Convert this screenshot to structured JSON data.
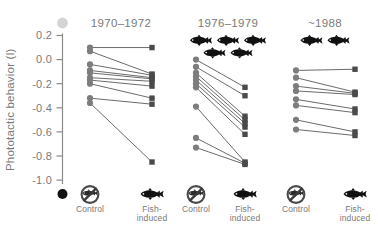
{
  "figure": {
    "background_color": "#ffffff",
    "text_color": "#7a7a7a",
    "marker_control_color": "#7d7d7d",
    "marker_fish_color": "#4a4a4a",
    "line_color": "#5a5a5a",
    "icon_color": "#111111"
  },
  "axis": {
    "title": "Phototactic behavior (l)",
    "tick_labels": [
      "0.2",
      "0.0",
      "-0.2",
      "-0.4",
      "-0.6",
      "-0.8",
      "-1.0"
    ],
    "tick_values": [
      0.2,
      0.0,
      -0.2,
      -0.4,
      -0.6,
      -0.8,
      -1.0
    ],
    "top_cap_marker": "light-grey-circle",
    "bottom_cap_marker": "black-circle"
  },
  "categories": {
    "control": {
      "label": "Control",
      "icon": "no-fish-icon",
      "icon_description": "fish silhouette inside circle with diagonal slash"
    },
    "fish_induced": {
      "label_line1": "Fish-",
      "label_line2": "induced",
      "label": "Fish-induced",
      "icon": "fish-icon",
      "icon_description": "fish silhouette"
    }
  },
  "panels": [
    {
      "title": "1970–1972",
      "fish_badge_count": 0,
      "fish_badge_rows": []
    },
    {
      "title": "1976–1979",
      "fish_badge_count": 5,
      "fish_badge_rows": [
        3,
        2
      ]
    },
    {
      "title": "~1988",
      "fish_badge_count": 2,
      "fish_badge_rows": [
        2
      ]
    }
  ],
  "chart_data": {
    "type": "line",
    "xlabel": "",
    "ylabel": "Phototactic behavior (l)",
    "ylim": [
      -1.05,
      0.25
    ],
    "yticks": [
      0.2,
      0.0,
      -0.2,
      -0.4,
      -0.6,
      -0.8,
      -1.0
    ],
    "grid": false,
    "legend": "none",
    "x_categories": [
      "Control",
      "Fish-induced"
    ],
    "panels": [
      {
        "name": "1970–1972",
        "fish_badge_count": 0,
        "pairs": [
          {
            "control": 0.1,
            "fish_induced": 0.1
          },
          {
            "control": 0.07,
            "fish_induced": -0.12
          },
          {
            "control": -0.04,
            "fish_induced": -0.13
          },
          {
            "control": -0.09,
            "fish_induced": -0.15
          },
          {
            "control": -0.11,
            "fish_induced": -0.16
          },
          {
            "control": -0.15,
            "fish_induced": -0.18
          },
          {
            "control": -0.17,
            "fish_induced": -0.22
          },
          {
            "control": -0.2,
            "fish_induced": -0.32
          },
          {
            "control": -0.32,
            "fish_induced": -0.37
          },
          {
            "control": -0.36,
            "fish_induced": -0.85
          }
        ]
      },
      {
        "name": "1976–1979",
        "fish_badge_count": 5,
        "pairs": [
          {
            "control": 0.0,
            "fish_induced": -0.23
          },
          {
            "control": -0.06,
            "fish_induced": -0.3
          },
          {
            "control": -0.11,
            "fish_induced": -0.47
          },
          {
            "control": -0.14,
            "fish_induced": -0.5
          },
          {
            "control": -0.17,
            "fish_induced": -0.53
          },
          {
            "control": -0.2,
            "fish_induced": -0.56
          },
          {
            "control": -0.23,
            "fish_induced": -0.62
          },
          {
            "control": -0.39,
            "fish_induced": -0.85
          },
          {
            "control": -0.65,
            "fish_induced": -0.86
          },
          {
            "control": -0.73,
            "fish_induced": -0.87
          }
        ]
      },
      {
        "name": "~1988",
        "fish_badge_count": 2,
        "pairs": [
          {
            "control": -0.09,
            "fish_induced": -0.08
          },
          {
            "control": -0.15,
            "fish_induced": -0.27
          },
          {
            "control": -0.22,
            "fish_induced": -0.28
          },
          {
            "control": -0.26,
            "fish_induced": -0.29
          },
          {
            "control": -0.33,
            "fish_induced": -0.41
          },
          {
            "control": -0.38,
            "fish_induced": -0.44
          },
          {
            "control": -0.5,
            "fish_induced": -0.6
          },
          {
            "control": -0.58,
            "fish_induced": -0.63
          }
        ]
      }
    ]
  }
}
